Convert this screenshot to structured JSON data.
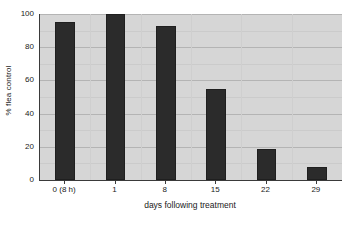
{
  "chart_data": {
    "type": "bar",
    "title": "",
    "subtitle": "",
    "xlabel": "days following treatment",
    "ylabel": "% flea control",
    "categories": [
      "0 (8 h)",
      "1",
      "8",
      "15",
      "22",
      "29"
    ],
    "values": [
      95,
      100,
      93,
      55,
      18.5,
      8
    ],
    "series": [
      {
        "name": "% flea control",
        "values": [
          95,
          100,
          93,
          55,
          18.5,
          8
        ]
      }
    ],
    "ylim": [
      0,
      100
    ],
    "ytick_labels": [
      "0",
      "20",
      "40",
      "60",
      "80",
      "100"
    ],
    "ytick_values": [
      0,
      20,
      40,
      60,
      80,
      100
    ],
    "minor_gridline_values": [
      10,
      30,
      50,
      70,
      90
    ],
    "grid": true,
    "grid_orientation": "horizontal",
    "legend": false,
    "legend_position": "none",
    "annotations": [],
    "colors": {
      "bar": "#2b2b2b",
      "bar_edge": "#1f1f1f",
      "plot_background": "#d6d6d6",
      "page_background": "#ffffff",
      "axis": "#3a3a3a",
      "gridline_major": "#b4b4b4",
      "gridline_minor": "#cbcbcb",
      "text": "#1a1a1a"
    }
  }
}
